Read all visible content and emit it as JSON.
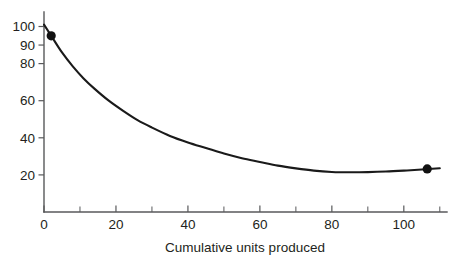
{
  "chart_data": {
    "type": "line",
    "title": "",
    "subtitle": "",
    "xlabel": "Cumulative units produced",
    "ylabel": "",
    "xlim": [
      0,
      112
    ],
    "ylim": [
      0,
      106
    ],
    "grid": false,
    "legend": false,
    "legend_position": "none",
    "x_ticks": [
      0,
      20,
      40,
      60,
      80,
      100
    ],
    "x_tick_labels": [
      "0",
      "20",
      "40",
      "60",
      "80",
      "100"
    ],
    "x_minor_ticks": [
      10,
      30,
      50,
      70,
      90,
      110
    ],
    "y_ticks": [
      20,
      40,
      60,
      80,
      90,
      100
    ],
    "y_tick_labels": [
      "20",
      "40",
      "60",
      "80",
      "90",
      "100"
    ],
    "series": [
      {
        "name": "Unit cost",
        "style": "solid-black-curve",
        "color": "#1a1a1a",
        "x": [
          0,
          2,
          5,
          8,
          11,
          14,
          18,
          22,
          26,
          30,
          35,
          40,
          45,
          50,
          55,
          60,
          65,
          70,
          75,
          80,
          85,
          90,
          95,
          100,
          105,
          110
        ],
        "y": [
          101,
          95,
          86,
          78.5,
          72,
          66.5,
          60,
          54.5,
          49.5,
          45.5,
          41,
          37.5,
          34.5,
          31.5,
          29,
          27,
          25,
          23.5,
          22.3,
          21.6,
          21.4,
          21.5,
          21.8,
          22.3,
          22.9,
          23.6
        ]
      }
    ],
    "markers": [
      {
        "name": "first-observation",
        "x": 2,
        "y": 95,
        "shape": "filled-circle",
        "color": "#111111"
      },
      {
        "name": "last-observation",
        "x": 106.5,
        "y": 23.2,
        "shape": "filled-circle",
        "color": "#111111"
      }
    ],
    "colors": {
      "curve": "#1a1a1a",
      "axis": "#58595b",
      "text": "#231f20",
      "background": "#ffffff",
      "marker": "#111111"
    }
  }
}
